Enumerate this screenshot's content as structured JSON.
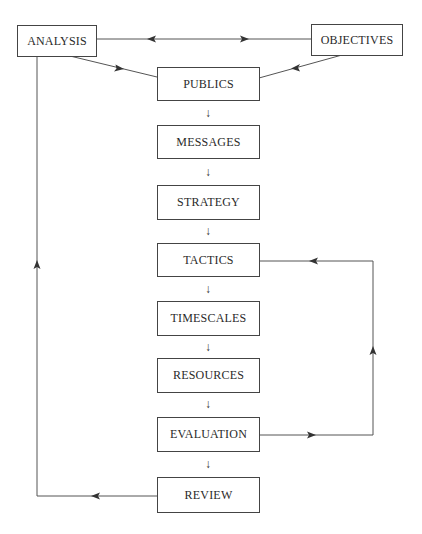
{
  "diagram": {
    "nodes": {
      "analysis": "ANALYSIS",
      "objectives": "OBJECTIVES",
      "publics": "PUBLICS",
      "messages": "MESSAGES",
      "strategy": "STRATEGY",
      "tactics": "TACTICS",
      "timescales": "TIMESCALES",
      "resources": "RESOURCES",
      "evaluation": "EVALUATION",
      "review": "REVIEW"
    },
    "flow_arrow": "↓",
    "edges": [
      {
        "from": "ANALYSIS",
        "to": "OBJECTIVES",
        "type": "bidirectional"
      },
      {
        "from": "ANALYSIS",
        "to": "PUBLICS"
      },
      {
        "from": "OBJECTIVES",
        "to": "PUBLICS"
      },
      {
        "from": "PUBLICS",
        "to": "MESSAGES"
      },
      {
        "from": "MESSAGES",
        "to": "STRATEGY"
      },
      {
        "from": "STRATEGY",
        "to": "TACTICS"
      },
      {
        "from": "TACTICS",
        "to": "TIMESCALES"
      },
      {
        "from": "TIMESCALES",
        "to": "RESOURCES"
      },
      {
        "from": "RESOURCES",
        "to": "EVALUATION"
      },
      {
        "from": "EVALUATION",
        "to": "REVIEW"
      },
      {
        "from": "EVALUATION",
        "to": "TACTICS",
        "type": "feedback"
      },
      {
        "from": "REVIEW",
        "to": "ANALYSIS",
        "type": "feedback"
      }
    ],
    "colors": {
      "line": "#444444",
      "text": "#2a2a2a",
      "background": "#ffffff"
    }
  }
}
